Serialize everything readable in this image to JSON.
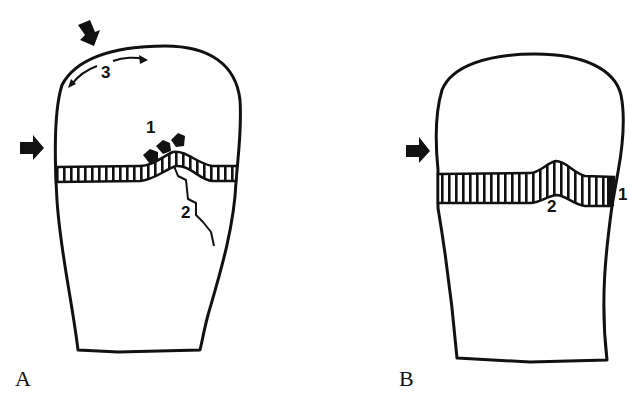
{
  "figure": {
    "panels": [
      {
        "id": "A",
        "label": "A",
        "callouts": {
          "one": "1",
          "two": "2",
          "three": "3"
        }
      },
      {
        "id": "B",
        "label": "B",
        "callouts": {
          "one": "1",
          "two": "2"
        }
      }
    ]
  },
  "colors": {
    "ink": "#111111",
    "background": "#ffffff"
  }
}
